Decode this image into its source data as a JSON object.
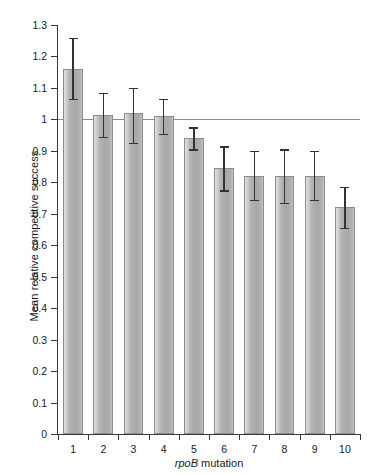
{
  "chart_data": {
    "type": "bar",
    "title": "",
    "xlabel": "rpoB mutation",
    "xlabel_italic_part": "rpoB",
    "xlabel_plain_part": " mutation",
    "ylabel": "Mean relative competitive success",
    "categories": [
      "1",
      "2",
      "3",
      "4",
      "5",
      "6",
      "7",
      "8",
      "9",
      "10"
    ],
    "values": [
      1.16,
      1.015,
      1.02,
      1.01,
      0.94,
      0.845,
      0.82,
      0.82,
      0.82,
      0.72
    ],
    "error_upper": [
      1.26,
      1.085,
      1.1,
      1.065,
      0.975,
      0.915,
      0.9,
      0.905,
      0.9,
      0.785
    ],
    "error_lower": [
      1.065,
      0.945,
      0.925,
      0.955,
      0.905,
      0.775,
      0.745,
      0.735,
      0.745,
      0.655
    ],
    "yticks": [
      0,
      0.1,
      0.2,
      0.3,
      0.4,
      0.5,
      0.6,
      0.7,
      0.8,
      0.9,
      1,
      1.1,
      1.2,
      1.3
    ],
    "ytick_labels": [
      "0",
      "0.1",
      "0.2",
      "0.3",
      "0.4",
      "0.5",
      "0.6",
      "0.7",
      "0.8",
      "0.9",
      "1",
      "1.1",
      "1.2",
      "1.3"
    ],
    "ylim": [
      0,
      1.3
    ],
    "reference_line": 1,
    "grid": false,
    "legend": null,
    "bar_fill_color": "#b0b0b0",
    "bar_edge_color": "#8d8d8d",
    "error_bar_color": "#333333",
    "axis_color": "#3a3a3a",
    "reference_line_color": "#8a8a8a",
    "background_color": "#ffffff"
  }
}
